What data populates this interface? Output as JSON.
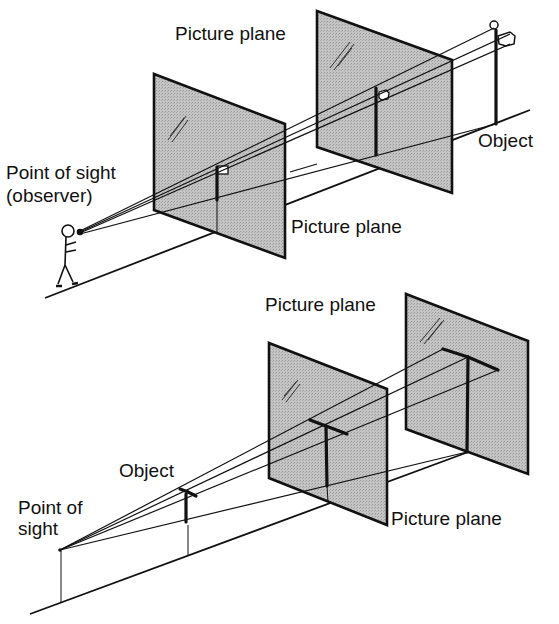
{
  "diagram": {
    "top_figure": {
      "labels": {
        "picture_plane_far": "Picture plane",
        "picture_plane_near": "Picture plane",
        "point_of_sight": "Point of sight",
        "observer": "(observer)",
        "object": "Object"
      }
    },
    "bottom_figure": {
      "labels": {
        "picture_plane_far": "Picture plane",
        "picture_plane_near": "Picture plane",
        "point_of_sight_line1": "Point of",
        "point_of_sight_line2": "sight",
        "object": "Object"
      }
    },
    "colors": {
      "ink": "#111111",
      "plane_fill": "#bdbdbd",
      "background": "#ffffff"
    }
  }
}
